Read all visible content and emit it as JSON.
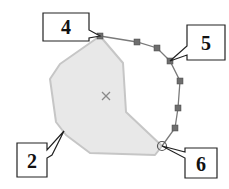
{
  "diagram": {
    "type": "shape-edit-callouts",
    "colors": {
      "polygon_fill": "#e8e8e8",
      "polygon_stroke": "#c6c6c6",
      "polyline_stroke": "#7a7a7a",
      "node_fill": "#6e6e6e",
      "callout_stroke": "#222222",
      "callout_fill": "#ffffff",
      "centroid_marker": "#8a8a8a"
    },
    "callouts": [
      {
        "id": "4",
        "label": "4",
        "target": "polyline start vertex"
      },
      {
        "id": "5",
        "label": "5",
        "target": "polyline intermediate vertex"
      },
      {
        "id": "6",
        "label": "6",
        "target": "polyline end vertex (snapped circle)"
      },
      {
        "id": "2",
        "label": "2",
        "target": "polygon edge"
      }
    ],
    "centroid_marker": "×"
  }
}
